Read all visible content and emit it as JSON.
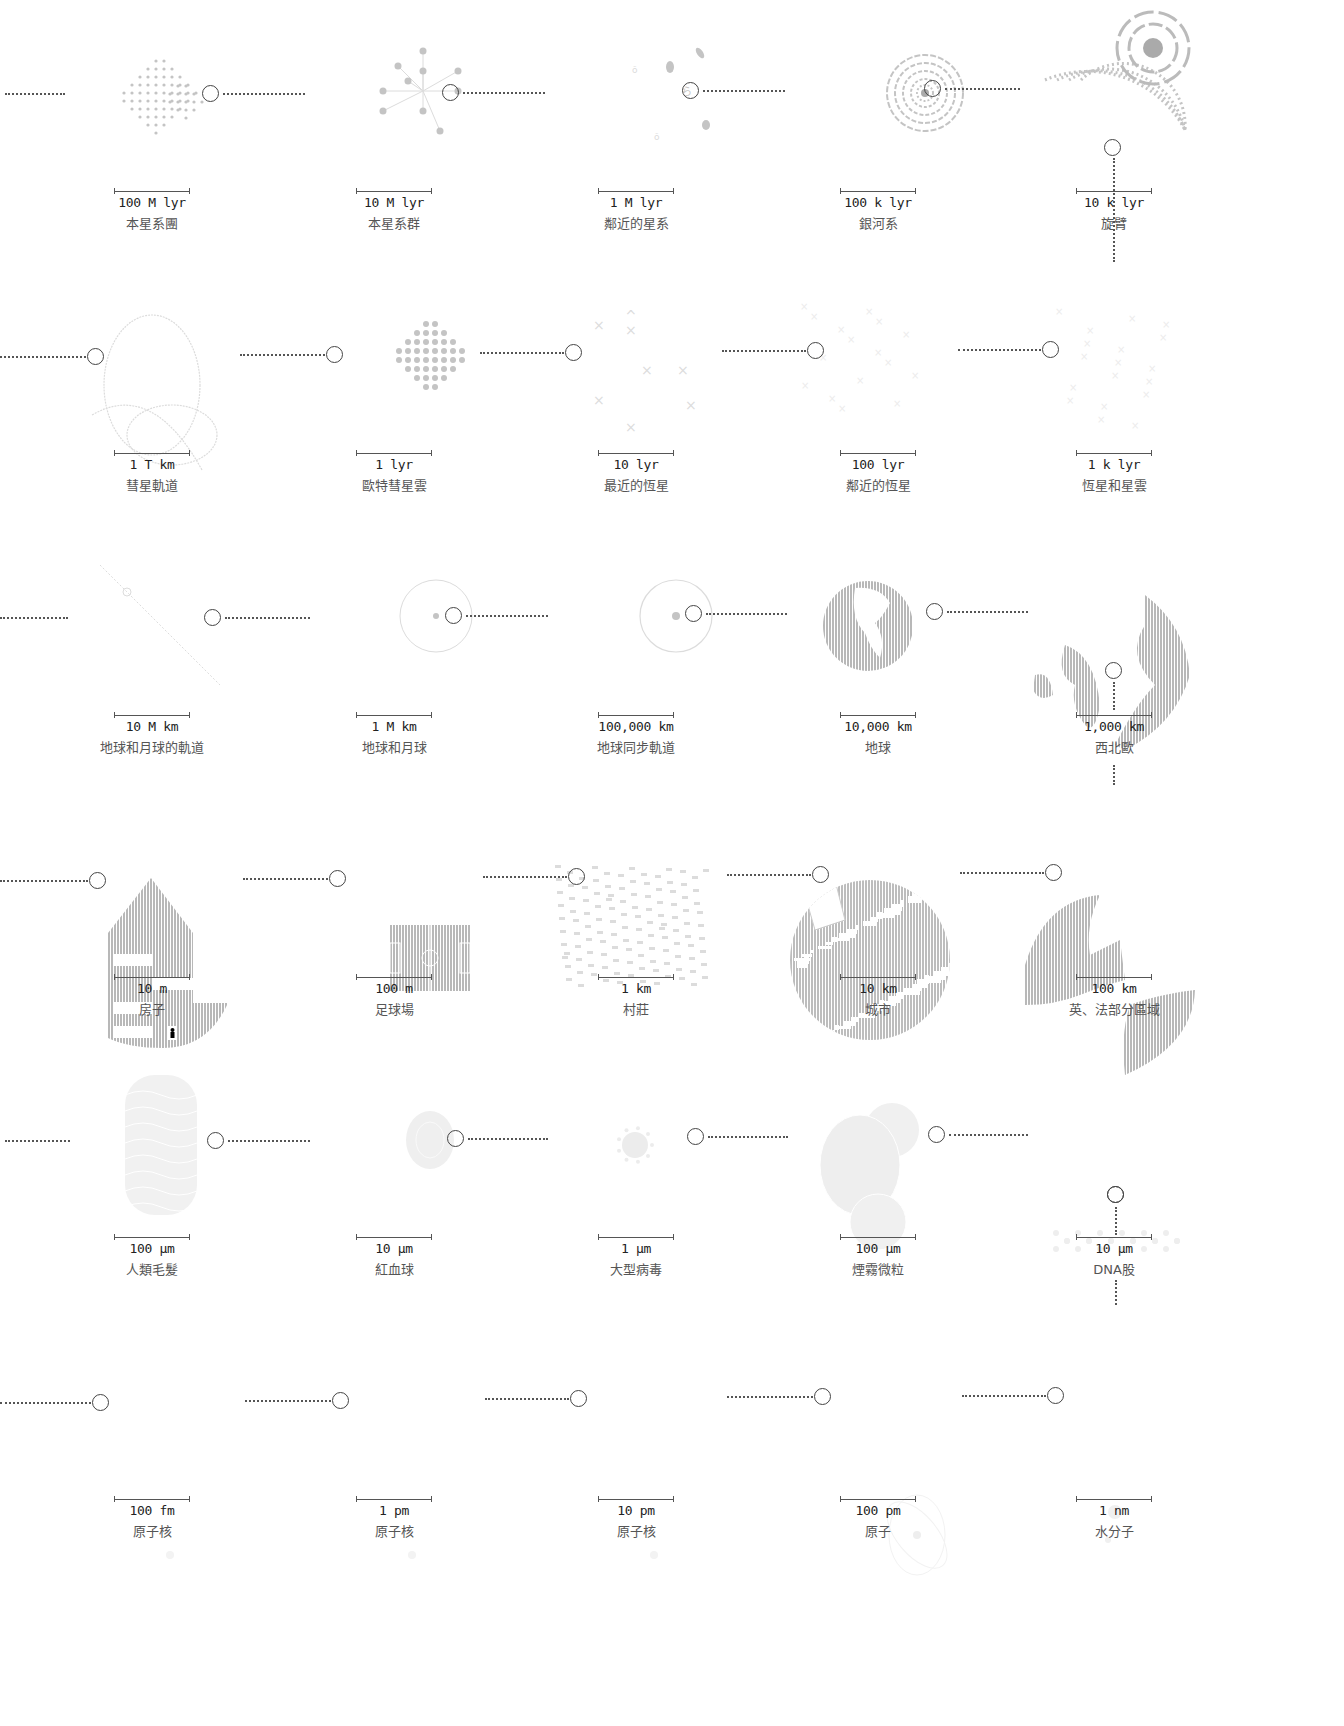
{
  "diagram": {
    "type": "powers-of-ten scale progression",
    "connector_color": "#555555",
    "illustration_color": "#bdbdbd",
    "rows": [
      {
        "items": [
          {
            "scale": "100 M lyr",
            "label": "本星系團",
            "icon": "supercluster-icon"
          },
          {
            "scale": "10 M lyr",
            "label": "本星系群",
            "icon": "local-group-icon"
          },
          {
            "scale": "1 M lyr",
            "label": "鄰近的星系",
            "icon": "nearby-galaxies-icon"
          },
          {
            "scale": "100 k lyr",
            "label": "銀河系",
            "icon": "milky-way-icon"
          },
          {
            "scale": "10 k lyr",
            "label": "旋臂",
            "icon": "spiral-arm-icon"
          }
        ]
      },
      {
        "items": [
          {
            "scale": "1 T km",
            "label": "彗星軌道",
            "icon": "comet-orbit-icon"
          },
          {
            "scale": "1 lyr",
            "label": "歐特彗星雲",
            "icon": "oort-cloud-icon"
          },
          {
            "scale": "10 lyr",
            "label": "最近的恆星",
            "icon": "nearest-stars-icon"
          },
          {
            "scale": "100 lyr",
            "label": "鄰近的恆星",
            "icon": "nearby-stars-icon"
          },
          {
            "scale": "1 k lyr",
            "label": "恆星和星雲",
            "icon": "stars-nebulae-icon"
          }
        ]
      },
      {
        "items": [
          {
            "scale": "10 M km",
            "label": "地球和月球的軌道",
            "icon": "earth-moon-orbit-icon"
          },
          {
            "scale": "1 M km",
            "label": "地球和月球",
            "icon": "earth-moon-icon"
          },
          {
            "scale": "100,000 km",
            "label": "地球同步軌道",
            "icon": "geosync-orbit-icon"
          },
          {
            "scale": "10,000 km",
            "label": "地球",
            "icon": "earth-globe-icon"
          },
          {
            "scale": "1,000 km",
            "label": "西北歐",
            "icon": "nw-europe-map-icon"
          }
        ]
      },
      {
        "items": [
          {
            "scale": "10 m",
            "label": "房子",
            "icon": "house-icon"
          },
          {
            "scale": "100 m",
            "label": "足球場",
            "icon": "football-pitch-icon"
          },
          {
            "scale": "1 km",
            "label": "村莊",
            "icon": "village-map-icon"
          },
          {
            "scale": "10 km",
            "label": "城市",
            "icon": "city-map-icon"
          },
          {
            "scale": "100 km",
            "label": "英、法部分區域",
            "icon": "uk-france-map-icon"
          }
        ]
      },
      {
        "items": [
          {
            "scale": "100 μm",
            "label": "人類毛髮",
            "icon": "human-hair-icon"
          },
          {
            "scale": "10 μm",
            "label": "紅血球",
            "icon": "red-blood-cell-icon"
          },
          {
            "scale": "1 μm",
            "label": "大型病毒",
            "icon": "virus-icon"
          },
          {
            "scale": "100 μm",
            "label": "煙霧微粒",
            "icon": "smoke-particle-icon"
          },
          {
            "scale": "10 μm",
            "label": "DNA股",
            "icon": "dna-strand-icon"
          }
        ]
      },
      {
        "items": [
          {
            "scale": "100 fm",
            "label": "原子核",
            "icon": "nucleus-icon"
          },
          {
            "scale": "1 pm",
            "label": "原子核",
            "icon": "nucleus-icon"
          },
          {
            "scale": "10 pm",
            "label": "原子核",
            "icon": "nucleus-icon"
          },
          {
            "scale": "100 pm",
            "label": "原子",
            "icon": "atom-icon"
          },
          {
            "scale": "1 nm",
            "label": "水分子",
            "icon": "water-molecule-icon"
          }
        ]
      }
    ]
  }
}
